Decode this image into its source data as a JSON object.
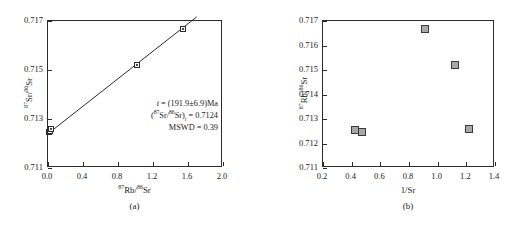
{
  "figure": {
    "caption_a": "(a)",
    "caption_b": "(b)"
  },
  "chart_data": [
    {
      "type": "scatter",
      "panel": "a",
      "title": "",
      "xlabel": "87Rb/86Sr",
      "ylabel": "87Sr/86Sr",
      "xlabel_parts": {
        "sup1": "87",
        "base1": "Rb/",
        "sup2": "86",
        "base2": "Sr"
      },
      "ylabel_parts": {
        "sup1": "87",
        "base1": "Sr/",
        "sup2": "86",
        "base2": "Sr"
      },
      "xlim": [
        0.0,
        2.0
      ],
      "ylim": [
        0.711,
        0.717
      ],
      "xticks": [
        0.0,
        0.4,
        0.8,
        1.2,
        1.6,
        2.0
      ],
      "xticklabels": [
        "0.0",
        "0.4",
        "0.8",
        "1.2",
        "1.6",
        "2.0"
      ],
      "yticks": [
        0.711,
        0.713,
        0.715,
        0.717
      ],
      "yticklabels": [
        "0.711",
        "0.713",
        "0.715",
        "0.717"
      ],
      "grid": false,
      "legend": "none",
      "points": [
        {
          "x": 0.012,
          "y": 0.71248
        },
        {
          "x": 0.022,
          "y": 0.71252
        },
        {
          "x": 0.03,
          "y": 0.71258
        },
        {
          "x": 1.02,
          "y": 0.71521
        },
        {
          "x": 1.548,
          "y": 0.71668
        }
      ],
      "fit_line": {
        "x0": 0.0,
        "y0": 0.7124,
        "x1": 1.7,
        "y1": 0.71717
      },
      "annotation": {
        "line1_pre": "t",
        "line1_post": " = (191.9±6.9)Ma",
        "line2_sup1": "87",
        "line2_mid": "Sr/",
        "line2_sup2": "86",
        "line2_end": "Sr)",
        "line2_sub": "i",
        "line2_value": " = 0.7124",
        "line3": "MSWD = 0.39"
      }
    },
    {
      "type": "scatter",
      "panel": "b",
      "title": "",
      "xlabel": "1/Sr",
      "ylabel": "87Rb/86Sr",
      "ylabel_parts": {
        "sup1": "87",
        "base1": "Rb/",
        "sup2": "86",
        "base2": "Sr"
      },
      "xlim": [
        0.2,
        1.4
      ],
      "ylim": [
        0.711,
        0.717
      ],
      "xticks": [
        0.2,
        0.4,
        0.6,
        0.8,
        1.0,
        1.2,
        1.4
      ],
      "xticklabels": [
        "0.2",
        "0.4",
        "0.6",
        "0.8",
        "1.0",
        "1.2",
        "1.4"
      ],
      "yticks": [
        0.711,
        0.712,
        0.713,
        0.714,
        0.715,
        0.716,
        0.717
      ],
      "yticklabels": [
        "0.711",
        "0.712",
        "0.713",
        "0.714",
        "0.715",
        "0.716",
        "0.717"
      ],
      "grid": false,
      "legend": "none",
      "points": [
        {
          "x": 0.425,
          "y": 0.71255
        },
        {
          "x": 0.47,
          "y": 0.71248
        },
        {
          "x": 0.91,
          "y": 0.71668
        },
        {
          "x": 1.12,
          "y": 0.7152
        },
        {
          "x": 1.22,
          "y": 0.7126
        }
      ]
    }
  ]
}
